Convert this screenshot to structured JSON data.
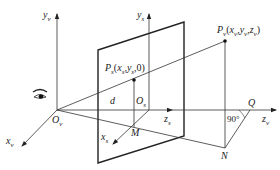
{
  "figure": {
    "type": "perspective projection diagram",
    "line_color": "#333333",
    "background": "#ffffff"
  },
  "labels": {
    "y_v": {
      "base": "y",
      "sub": "v"
    },
    "y_s": {
      "base": "y",
      "sub": "s"
    },
    "x_v": {
      "base": "x",
      "sub": "v"
    },
    "x_s": {
      "base": "x",
      "sub": "s"
    },
    "z_s": {
      "base": "z",
      "sub": "s"
    },
    "z_v": {
      "base": "z",
      "sub": "v"
    },
    "O_v": {
      "base": "O",
      "sub": "v"
    },
    "O_s": {
      "base": "O",
      "sub": "s"
    },
    "P_v": {
      "base": "P",
      "sub": "v",
      "coords": "(x",
      "c1": "v",
      "c2": "y",
      "c3": "v",
      "c4": "z",
      "c5": "v",
      "close": ")"
    },
    "P_s": {
      "base": "P",
      "sub": "s",
      "text": "(x",
      "c1": "s",
      "mid": ",y",
      "c2": "s",
      "tail": ",0)"
    },
    "d": "d",
    "M": "M",
    "N": "N",
    "Q": "Q",
    "angle": "90°"
  },
  "icons": {
    "eye": "eye-icon"
  }
}
